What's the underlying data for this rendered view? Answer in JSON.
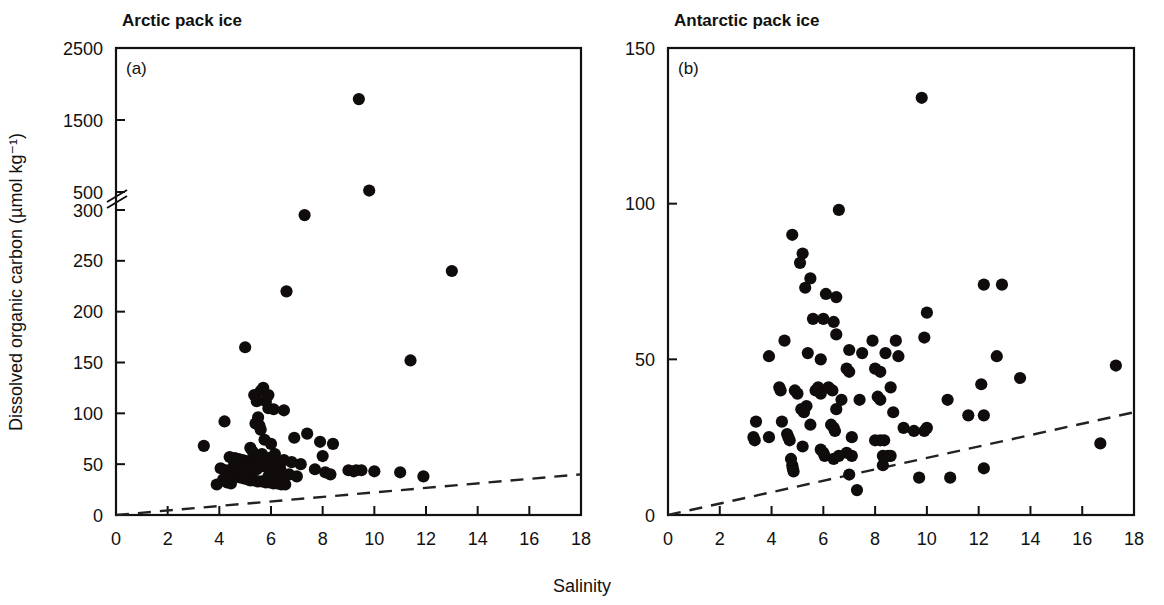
{
  "figure": {
    "xlabel": "Salinity",
    "ylabel": "Dissolved organic carbon (µmol kg⁻¹)",
    "background": "#ffffff",
    "marker_color": "#100c0c",
    "line_color": "#222222"
  },
  "chart_data": [
    {
      "type": "scatter",
      "panel": "a",
      "panel_letter": "(a)",
      "title": "Arctic pack ice",
      "xlabel": "Salinity",
      "ylabel": "Dissolved organic carbon (µmol kg⁻¹)",
      "xlim": [
        0,
        18
      ],
      "ylim": [
        0,
        2500
      ],
      "grid": false,
      "legend": "none",
      "axis_break": {
        "between": [
          300,
          500
        ],
        "label_upper": "500",
        "label_lower": "300"
      },
      "xticks": [
        0,
        2,
        4,
        6,
        8,
        10,
        12,
        14,
        16,
        18
      ],
      "xticklabels": [
        "0",
        "2",
        "4",
        "6",
        "8",
        "10",
        "12",
        "14",
        "16",
        "18"
      ],
      "yticks": [
        0,
        50,
        100,
        150,
        200,
        250,
        300,
        500,
        1500,
        2500
      ],
      "yticklabels": [
        "0",
        "50",
        "100",
        "150",
        "200",
        "250",
        "300",
        "500",
        "1500",
        "2500"
      ],
      "annotations": [
        "dashed reference line from (0,0) to (18,40)"
      ],
      "reference_line": {
        "style": "dashed",
        "x": [
          0,
          18
        ],
        "y": [
          0,
          40
        ]
      },
      "points": [
        [
          9.4,
          1790
        ],
        [
          9.8,
          520
        ],
        [
          7.3,
          295
        ],
        [
          6.6,
          220
        ],
        [
          13.0,
          240
        ],
        [
          5.0,
          165
        ],
        [
          11.4,
          152
        ],
        [
          5.7,
          125
        ],
        [
          5.6,
          122
        ],
        [
          5.9,
          118
        ],
        [
          5.8,
          112
        ],
        [
          5.9,
          105
        ],
        [
          6.1,
          104
        ],
        [
          5.35,
          118
        ],
        [
          5.45,
          112
        ],
        [
          4.2,
          92
        ],
        [
          6.5,
          103
        ],
        [
          5.5,
          96
        ],
        [
          5.4,
          90
        ],
        [
          5.55,
          88
        ],
        [
          5.6,
          84
        ],
        [
          7.4,
          80
        ],
        [
          6.9,
          76
        ],
        [
          5.75,
          74
        ],
        [
          7.9,
          72
        ],
        [
          6.0,
          70
        ],
        [
          3.4,
          68
        ],
        [
          5.2,
          66
        ],
        [
          5.3,
          62
        ],
        [
          5.65,
          60
        ],
        [
          6.15,
          60
        ],
        [
          8.4,
          70
        ],
        [
          8.0,
          58
        ],
        [
          4.4,
          57
        ],
        [
          4.6,
          56
        ],
        [
          4.75,
          55
        ],
        [
          4.9,
          54
        ],
        [
          5.05,
          53
        ],
        [
          5.15,
          52
        ],
        [
          5.25,
          51
        ],
        [
          5.4,
          50
        ],
        [
          5.5,
          49
        ],
        [
          5.6,
          49
        ],
        [
          5.7,
          48
        ],
        [
          5.85,
          48
        ],
        [
          6.0,
          47
        ],
        [
          6.2,
          47
        ],
        [
          6.35,
          46
        ],
        [
          6.5,
          54
        ],
        [
          6.8,
          52
        ],
        [
          7.15,
          50
        ],
        [
          9.0,
          44
        ],
        [
          9.3,
          44
        ],
        [
          9.5,
          44
        ],
        [
          9.2,
          43
        ],
        [
          10.0,
          43
        ],
        [
          11.0,
          42
        ],
        [
          11.9,
          38
        ],
        [
          4.25,
          44
        ],
        [
          4.35,
          42
        ],
        [
          4.5,
          40
        ],
        [
          4.65,
          38
        ],
        [
          4.8,
          37
        ],
        [
          4.95,
          36
        ],
        [
          5.1,
          35
        ],
        [
          5.2,
          34
        ],
        [
          5.35,
          34
        ],
        [
          5.5,
          33
        ],
        [
          5.65,
          33
        ],
        [
          5.8,
          32
        ],
        [
          5.95,
          32
        ],
        [
          6.1,
          31
        ],
        [
          6.25,
          31
        ],
        [
          6.4,
          30
        ],
        [
          6.55,
          30
        ],
        [
          4.3,
          32
        ],
        [
          4.45,
          31
        ],
        [
          4.15,
          35
        ],
        [
          4.05,
          46
        ],
        [
          7.7,
          45
        ],
        [
          8.1,
          42
        ],
        [
          8.3,
          40
        ],
        [
          6.7,
          40
        ],
        [
          7.0,
          38
        ],
        [
          3.9,
          30
        ],
        [
          5.0,
          42
        ],
        [
          5.3,
          44
        ],
        [
          5.45,
          45
        ],
        [
          6.3,
          42
        ],
        [
          6.45,
          38
        ],
        [
          5.9,
          38
        ],
        [
          6.05,
          36
        ],
        [
          4.55,
          48
        ],
        [
          4.7,
          46
        ],
        [
          5.15,
          46
        ],
        [
          5.9,
          56
        ],
        [
          6.1,
          55
        ],
        [
          5.5,
          58
        ],
        [
          5.0,
          46
        ],
        [
          4.85,
          44
        ]
      ]
    },
    {
      "type": "scatter",
      "panel": "b",
      "panel_letter": "(b)",
      "title": "Antarctic pack ice",
      "xlabel": "Salinity",
      "ylabel": "Dissolved organic carbon (µmol kg⁻¹)",
      "xlim": [
        0,
        18
      ],
      "ylim": [
        0,
        150
      ],
      "grid": false,
      "legend": "none",
      "xticks": [
        0,
        2,
        4,
        6,
        8,
        10,
        12,
        14,
        16,
        18
      ],
      "xticklabels": [
        "0",
        "2",
        "4",
        "6",
        "8",
        "10",
        "12",
        "14",
        "16",
        "18"
      ],
      "yticks": [
        0,
        50,
        100,
        150
      ],
      "yticklabels": [
        "0",
        "50",
        "100",
        "150"
      ],
      "annotations": [
        "dashed reference line from (0,0) to (18,33)"
      ],
      "reference_line": {
        "style": "dashed",
        "x": [
          0,
          18
        ],
        "y": [
          0,
          33
        ]
      },
      "points": [
        [
          9.8,
          134
        ],
        [
          6.6,
          98
        ],
        [
          4.8,
          90
        ],
        [
          5.2,
          84
        ],
        [
          5.1,
          81
        ],
        [
          5.5,
          76
        ],
        [
          5.3,
          73
        ],
        [
          12.2,
          74
        ],
        [
          12.9,
          74
        ],
        [
          6.1,
          71
        ],
        [
          6.5,
          70
        ],
        [
          10.0,
          65
        ],
        [
          5.6,
          63
        ],
        [
          6.0,
          63
        ],
        [
          6.4,
          62
        ],
        [
          6.5,
          58
        ],
        [
          4.5,
          56
        ],
        [
          7.9,
          56
        ],
        [
          8.8,
          56
        ],
        [
          9.9,
          57
        ],
        [
          5.4,
          52
        ],
        [
          7.0,
          53
        ],
        [
          7.5,
          52
        ],
        [
          8.4,
          52
        ],
        [
          8.9,
          51
        ],
        [
          3.9,
          51
        ],
        [
          5.9,
          50
        ],
        [
          12.7,
          51
        ],
        [
          17.3,
          48
        ],
        [
          6.9,
          47
        ],
        [
          7.0,
          46
        ],
        [
          8.0,
          47
        ],
        [
          8.2,
          46
        ],
        [
          13.6,
          44
        ],
        [
          12.1,
          42
        ],
        [
          4.3,
          41
        ],
        [
          4.35,
          40
        ],
        [
          4.9,
          40
        ],
        [
          5.0,
          39
        ],
        [
          5.7,
          40
        ],
        [
          5.8,
          41
        ],
        [
          5.9,
          39
        ],
        [
          6.2,
          41
        ],
        [
          6.35,
          40
        ],
        [
          8.6,
          41
        ],
        [
          6.7,
          37
        ],
        [
          7.4,
          37
        ],
        [
          8.1,
          38
        ],
        [
          8.2,
          37
        ],
        [
          10.8,
          37
        ],
        [
          5.15,
          34
        ],
        [
          5.25,
          33
        ],
        [
          5.35,
          35
        ],
        [
          6.5,
          34
        ],
        [
          8.7,
          33
        ],
        [
          11.6,
          32
        ],
        [
          12.2,
          32
        ],
        [
          3.4,
          30
        ],
        [
          4.4,
          30
        ],
        [
          5.5,
          29
        ],
        [
          6.3,
          29
        ],
        [
          6.4,
          28
        ],
        [
          6.45,
          27
        ],
        [
          9.1,
          28
        ],
        [
          9.5,
          27
        ],
        [
          9.9,
          27
        ],
        [
          10.0,
          28
        ],
        [
          3.3,
          25
        ],
        [
          3.35,
          24
        ],
        [
          3.9,
          25
        ],
        [
          4.6,
          26
        ],
        [
          4.65,
          25
        ],
        [
          4.7,
          24
        ],
        [
          7.1,
          25
        ],
        [
          8.0,
          24
        ],
        [
          8.2,
          24
        ],
        [
          8.35,
          24
        ],
        [
          16.7,
          23
        ],
        [
          5.2,
          22
        ],
        [
          5.9,
          21
        ],
        [
          6.0,
          20
        ],
        [
          6.05,
          19
        ],
        [
          6.9,
          20
        ],
        [
          7.1,
          19
        ],
        [
          8.3,
          19
        ],
        [
          8.5,
          19
        ],
        [
          8.6,
          19
        ],
        [
          6.4,
          18
        ],
        [
          6.6,
          19
        ],
        [
          4.75,
          18
        ],
        [
          4.8,
          16
        ],
        [
          4.82,
          15
        ],
        [
          4.85,
          14
        ],
        [
          8.3,
          16
        ],
        [
          12.2,
          15
        ],
        [
          7.0,
          13
        ],
        [
          9.7,
          12
        ],
        [
          10.9,
          12
        ],
        [
          7.3,
          8
        ]
      ]
    }
  ]
}
